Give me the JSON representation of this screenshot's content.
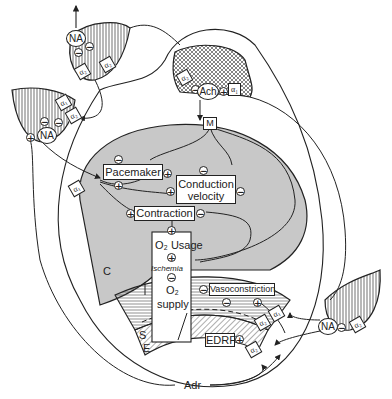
{
  "diagram": {
    "colors": {
      "line": "#222222",
      "myocardium_fill": "#c8c8c8",
      "background": "#ffffff"
    },
    "regions": {
      "cardiac": {
        "letter": "C"
      },
      "smooth_muscle": {
        "letter": "S"
      },
      "endothelium": {
        "letter": "E"
      }
    },
    "nodes": {
      "m_receptor": "M",
      "pacemaker": "Pacemaker",
      "conduction_line1": "Conduction",
      "conduction_line2": "velocity",
      "contraction": "Contraction",
      "o2_usage": "O₂ Usage",
      "ischemia": "Ischemia",
      "o2_supply_line1": "O₂",
      "o2_supply_line2": "supply",
      "vasoconstriction": "Vasoconstriction",
      "edrf": "EDRF",
      "adrenaline": "Adr"
    },
    "nerve_terminals": {
      "top_left": {
        "transmitter": "NA",
        "receptors": [
          "α₂",
          "α₂"
        ]
      },
      "left": {
        "transmitter": "NA",
        "receptors": [
          "α₁",
          "α₂"
        ]
      },
      "cholinergic": {
        "transmitter": "Ach",
        "receptors": [
          "α₂",
          "α₁"
        ]
      },
      "right": {
        "transmitter": "NA",
        "receptors": [
          "α₂"
        ]
      }
    },
    "receptors": {
      "cardiac_alpha1": "α₁",
      "vascular_alpha1": "α₁",
      "vascular_alpha2": "α₂",
      "endothelial_alpha2": "α₂"
    },
    "signs": {
      "plus": "+",
      "minus": "−"
    }
  }
}
